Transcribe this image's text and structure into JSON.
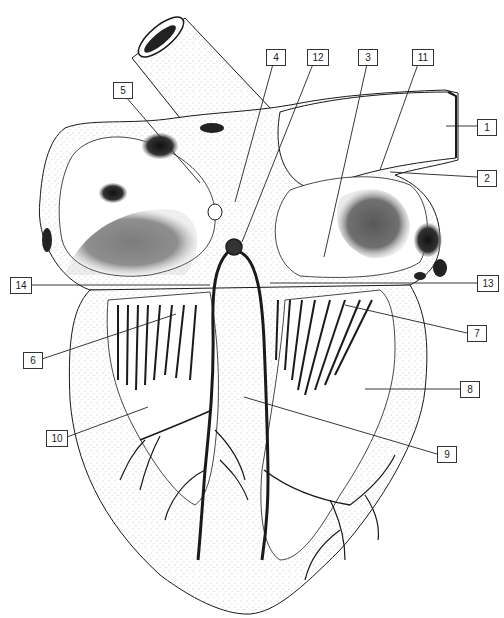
{
  "diagram": {
    "labels": [
      {
        "id": "1",
        "text": "1",
        "x": 477,
        "y": 119
      },
      {
        "id": "2",
        "text": "2",
        "x": 477,
        "y": 170
      },
      {
        "id": "3",
        "text": "3",
        "x": 358,
        "y": 49
      },
      {
        "id": "4",
        "text": "4",
        "x": 266,
        "y": 49
      },
      {
        "id": "5",
        "text": "5",
        "x": 113,
        "y": 82
      },
      {
        "id": "6",
        "text": "6",
        "x": 23,
        "y": 352
      },
      {
        "id": "7",
        "text": "7",
        "x": 467,
        "y": 325
      },
      {
        "id": "8",
        "text": "8",
        "x": 460,
        "y": 381
      },
      {
        "id": "9",
        "text": "9",
        "x": 437,
        "y": 446
      },
      {
        "id": "10",
        "text": "10",
        "x": 46,
        "y": 430
      },
      {
        "id": "11",
        "text": "11",
        "x": 412,
        "y": 49
      },
      {
        "id": "12",
        "text": "12",
        "x": 307,
        "y": 49
      },
      {
        "id": "13",
        "text": "13",
        "x": 477,
        "y": 275
      },
      {
        "id": "14",
        "text": "14",
        "x": 10,
        "y": 277
      }
    ],
    "leader_lines": [
      {
        "label": "1",
        "x1": 477,
        "y1": 126,
        "x2": 446,
        "y2": 126
      },
      {
        "label": "2",
        "x1": 477,
        "y1": 177,
        "x2": 390,
        "y2": 172
      },
      {
        "label": "3",
        "x1": 367,
        "y1": 64,
        "x2": 324,
        "y2": 257
      },
      {
        "label": "4",
        "x1": 273,
        "y1": 64,
        "x2": 235,
        "y2": 202
      },
      {
        "label": "5",
        "x1": 126,
        "y1": 97,
        "x2": 200,
        "y2": 183
      },
      {
        "label": "6",
        "x1": 42,
        "y1": 359,
        "x2": 176,
        "y2": 314
      },
      {
        "label": "7",
        "x1": 467,
        "y1": 333,
        "x2": 345,
        "y2": 305
      },
      {
        "label": "8",
        "x1": 460,
        "y1": 389,
        "x2": 365,
        "y2": 389
      },
      {
        "label": "9",
        "x1": 437,
        "y1": 454,
        "x2": 244,
        "y2": 397
      },
      {
        "label": "10",
        "x1": 67,
        "y1": 437,
        "x2": 148,
        "y2": 407
      },
      {
        "label": "11",
        "x1": 418,
        "y1": 64,
        "x2": 380,
        "y2": 170
      },
      {
        "label": "12",
        "x1": 313,
        "y1": 64,
        "x2": 242,
        "y2": 242
      },
      {
        "label": "13",
        "x1": 477,
        "y1": 283,
        "x2": 270,
        "y2": 283
      },
      {
        "label": "14",
        "x1": 29,
        "y1": 285,
        "x2": 210,
        "y2": 285
      }
    ],
    "colors": {
      "ink": "#1a1a1a",
      "stipple": "#9a9a9a",
      "background": "#ffffff",
      "label_border": "#333333"
    }
  }
}
